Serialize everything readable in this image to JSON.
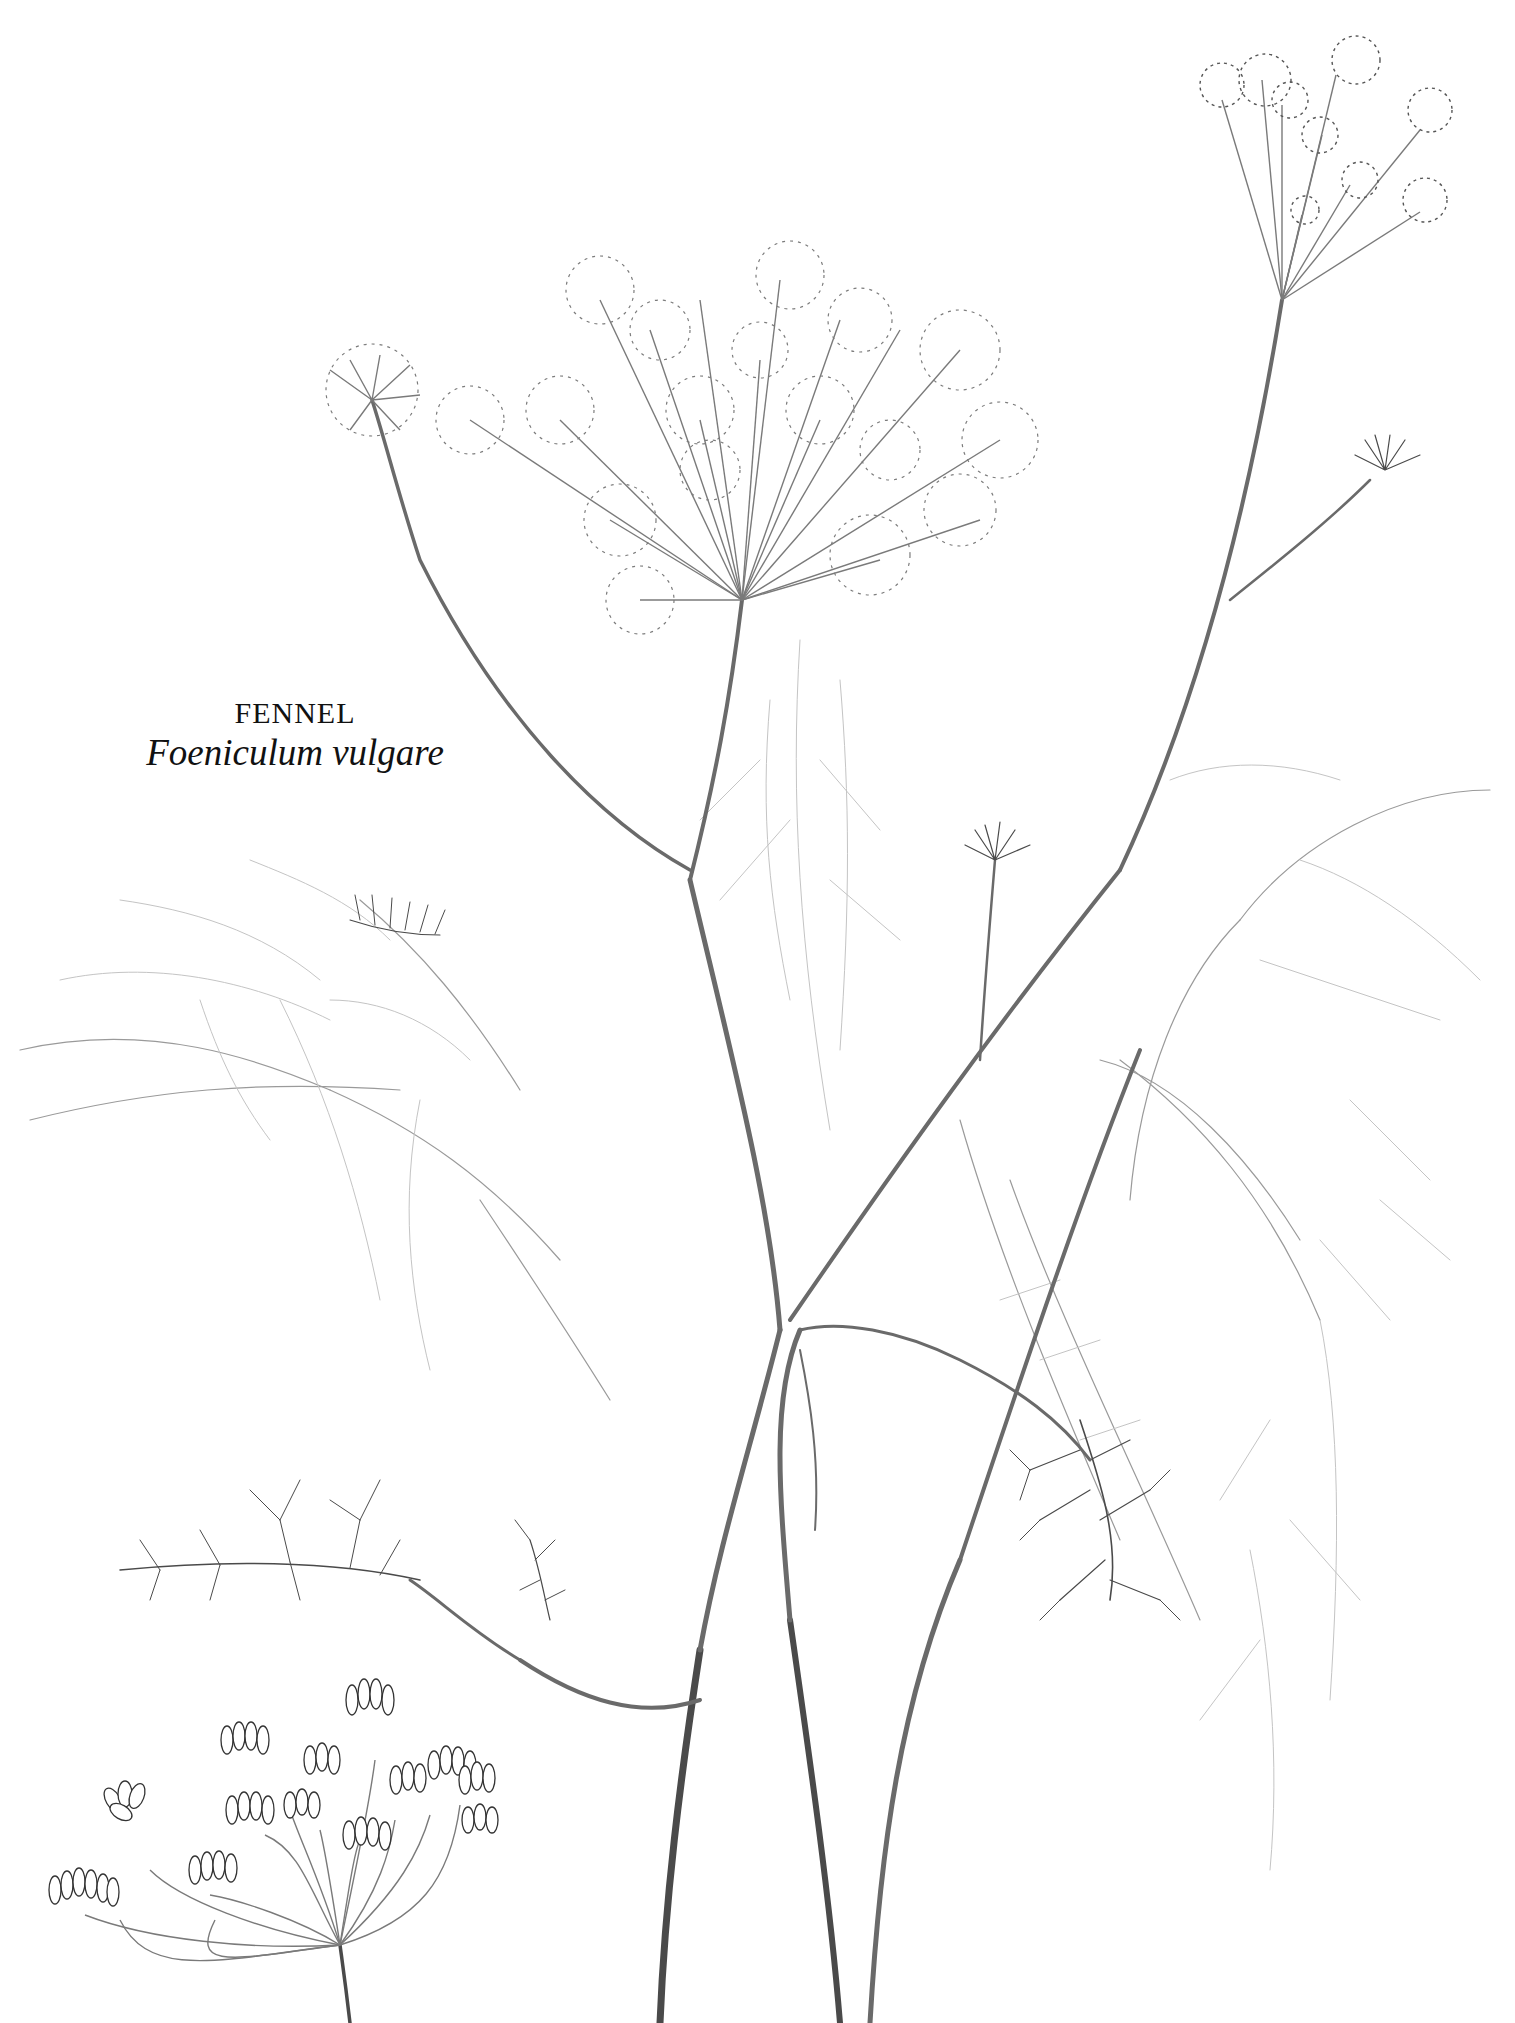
{
  "caption": {
    "common_name": "FENNEL",
    "latin_name": "Foeniculum vulgare"
  },
  "illustration": {
    "subject": "fennel plant botanical pencil drawing",
    "elements": [
      "main-flower-umbel",
      "top-right-flower-umbel",
      "small-bud-umbel",
      "seed-head-umbel",
      "feathery-leaves",
      "main-stems"
    ],
    "colors": {
      "background": "#ffffff",
      "pencil": "#6a6a6a",
      "text": "#111111"
    }
  }
}
